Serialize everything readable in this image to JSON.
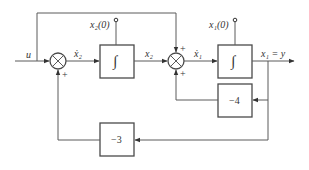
{
  "diagram": {
    "type": "block-diagram",
    "input": {
      "label": "u"
    },
    "output": {
      "label": "x₁ = y"
    },
    "summing_junctions": [
      {
        "id": "sum1",
        "signs": [
          "+"
        ]
      },
      {
        "id": "sum2",
        "signs": [
          "+",
          "+"
        ]
      }
    ],
    "integrators": [
      {
        "id": "int2",
        "symbol": "∫",
        "initial_condition": "x₂(0)",
        "input_label": "ẋ₂",
        "output_label": "x₂"
      },
      {
        "id": "int1",
        "symbol": "∫",
        "initial_condition": "x₁(0)",
        "input_label": "ẋ₁",
        "output_label": "x₁ = y"
      }
    ],
    "gains": [
      {
        "id": "gain_inner",
        "value": "−4"
      },
      {
        "id": "gain_outer",
        "value": "−3"
      }
    ],
    "plus_sign": "+"
  }
}
